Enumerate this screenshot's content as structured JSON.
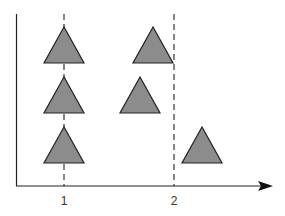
{
  "diagram": {
    "type": "schematic-triangle-groups",
    "colors": {
      "background": "#ffffff",
      "axis": "#222222",
      "triangle_fill": "#8c8c8c",
      "triangle_stroke": "#222222",
      "dashed_line": "#444444"
    },
    "axes": {
      "x_axis": {
        "has_arrow": true
      },
      "y_axis": {
        "has_arrow": false
      }
    },
    "x_ticks": [
      {
        "label": "1"
      },
      {
        "label": "2"
      }
    ],
    "dashed_lines": [
      {
        "at_tick": "1"
      },
      {
        "at_tick": "2"
      }
    ],
    "triangles": [
      {
        "group": "1",
        "row": "top"
      },
      {
        "group": "1",
        "row": "middle"
      },
      {
        "group": "1",
        "row": "bottom"
      },
      {
        "group": "between-1-2",
        "row": "top"
      },
      {
        "group": "between-1-2",
        "row": "middle"
      },
      {
        "group": "right-of-2",
        "row": "bottom"
      }
    ]
  }
}
